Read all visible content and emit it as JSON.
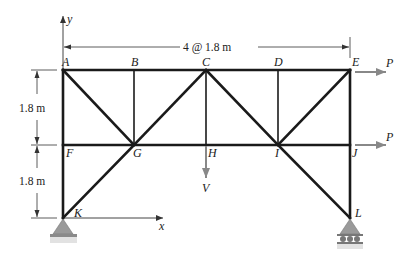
{
  "figure": {
    "type": "plane-truss",
    "colors": {
      "member": "#1a1a1a",
      "force_arrow": "#888888",
      "support_fill": "#9a9a9a",
      "support_base": "#8a8a8a",
      "text": "#222222"
    }
  },
  "axes": {
    "x_label": "x",
    "y_label": "y"
  },
  "dimensions": {
    "horizontal": "4 @ 1.8 m",
    "vertical_upper": "1.8 m",
    "vertical_lower": "1.8 m"
  },
  "joints": {
    "A": {
      "label": "A"
    },
    "B": {
      "label": "B"
    },
    "C": {
      "label": "C"
    },
    "D": {
      "label": "D"
    },
    "E": {
      "label": "E"
    },
    "F": {
      "label": "F"
    },
    "G": {
      "label": "G"
    },
    "H": {
      "label": "H"
    },
    "I": {
      "label": "I"
    },
    "J": {
      "label": "J"
    },
    "K": {
      "label": "K"
    },
    "L": {
      "label": "L"
    }
  },
  "members": [
    [
      "A",
      "B"
    ],
    [
      "B",
      "C"
    ],
    [
      "C",
      "D"
    ],
    [
      "D",
      "E"
    ],
    [
      "F",
      "G"
    ],
    [
      "G",
      "H"
    ],
    [
      "H",
      "I"
    ],
    [
      "I",
      "J"
    ],
    [
      "A",
      "F"
    ],
    [
      "F",
      "K"
    ],
    [
      "B",
      "G"
    ],
    [
      "C",
      "H"
    ],
    [
      "D",
      "I"
    ],
    [
      "E",
      "J"
    ],
    [
      "J",
      "L"
    ],
    [
      "A",
      "G"
    ],
    [
      "C",
      "G"
    ],
    [
      "C",
      "I"
    ],
    [
      "E",
      "I"
    ],
    [
      "G",
      "K"
    ],
    [
      "I",
      "L"
    ]
  ],
  "loads": {
    "P_top": {
      "label": "P",
      "joint": "E",
      "direction": "right"
    },
    "P_mid": {
      "label": "P",
      "joint": "J",
      "direction": "right"
    },
    "V": {
      "label": "V",
      "joint": "H",
      "direction": "down"
    }
  },
  "supports": {
    "K": {
      "type": "pin"
    },
    "L": {
      "type": "roller"
    }
  }
}
